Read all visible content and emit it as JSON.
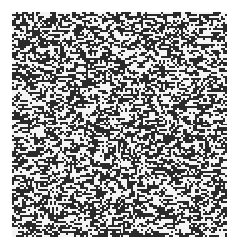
{
  "image": {
    "subject": "random binary noise pattern",
    "colors": {
      "background": "#ffffff",
      "dark": "#2a2a2a",
      "light": "#f4f4f4"
    },
    "dark_fraction": 0.5
  }
}
